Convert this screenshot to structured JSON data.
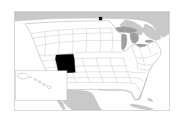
{
  "figure": {
    "kind": "locator-map",
    "region": "United States",
    "projection_note": "contiguous US with Alaska and Hawaii inset",
    "frame": {
      "left": 14,
      "top": 11,
      "width": 156,
      "height": 100
    }
  },
  "colors": {
    "background": "#ffffff",
    "land_fill": "#ffffff",
    "state_border": "#b9b9b9",
    "country_border": "#9a9a9a",
    "frame_border": "#d8d8d8",
    "highlight_fill": "#000000",
    "water_fill": "#9e9e9e",
    "foreign_land_fill": "#c9c9c9",
    "marker_fill": "#111111"
  },
  "highlight": {
    "name": "New Mexico",
    "abbr": "NM",
    "fill": "#000000"
  },
  "markers": [
    {
      "name": "marker-north-plains",
      "x": 101,
      "y": 17,
      "size": 4,
      "fill": "#111111"
    }
  ],
  "water_bodies": [
    {
      "name": "Lake Superior"
    },
    {
      "name": "Lake Michigan"
    },
    {
      "name": "Lake Huron"
    },
    {
      "name": "Lake Erie"
    },
    {
      "name": "Lake Ontario"
    }
  ],
  "foreign_regions": [
    {
      "name": "Canada"
    },
    {
      "name": "Mexico"
    },
    {
      "name": "Cuba"
    },
    {
      "name": "Bahamas"
    }
  ],
  "inset": {
    "name": "alaska-hawaii-inset",
    "label": "",
    "left": 2,
    "top": 60,
    "width": 52,
    "height": 30
  },
  "legend": {
    "visible": false,
    "entries": []
  },
  "title": "",
  "subtitle": ""
}
